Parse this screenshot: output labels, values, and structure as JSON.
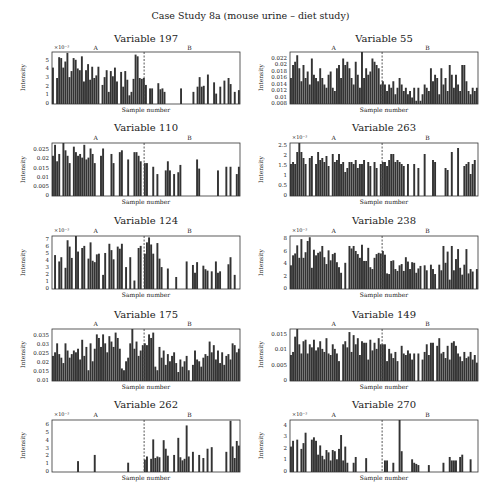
{
  "title": "Case Study 8a (mouse urine – diet study)",
  "colors": {
    "bar": "#333333",
    "divider": "#444444",
    "frame": "#333333"
  },
  "chart_data": [
    {
      "type": "bar",
      "title": "Variable 197",
      "xlabel": "Sample number",
      "ylabel": "Intensity",
      "exponent": "×10⁻³",
      "groups": [
        "A",
        "B"
      ],
      "yticks": [
        "0",
        "1",
        "2",
        "3",
        "4",
        "5"
      ],
      "ylim": [
        0,
        6
      ],
      "divider_fraction": 0.49,
      "values": [
        4.2,
        0,
        3.0,
        5.4,
        5.3,
        4.2,
        4.9,
        5.9,
        3.1,
        3.8,
        5.3,
        5.1,
        4.1,
        3.9,
        5.5,
        2.6,
        3.9,
        4.6,
        2.8,
        4.3,
        3.0,
        3.3,
        4.3,
        0,
        2.2,
        3.1,
        3.9,
        1.4,
        3.8,
        3.2,
        4.2,
        2.6,
        0,
        3.7,
        2.0,
        3.8,
        2.8,
        1.0,
        1.4,
        2.9,
        5.7,
        5.5,
        3.0,
        2.9,
        3.0,
        2.2,
        0,
        1.8,
        1.8,
        0,
        0,
        2.4,
        1.7,
        1.8,
        1.4,
        0,
        0,
        0,
        0,
        0,
        0,
        0,
        1.8,
        0,
        0,
        0,
        0,
        0,
        1.4,
        0,
        2.0,
        3.1,
        2.0,
        2.1,
        0,
        3.4,
        0,
        0,
        2.5,
        1.2,
        0,
        2.0,
        0,
        2.7,
        0,
        3.0,
        2.3,
        0,
        1.4,
        0,
        1.6
      ]
    },
    {
      "type": "bar",
      "title": "Variable 55",
      "xlabel": "Sample number",
      "ylabel": "Intensity",
      "groups": [
        "A",
        "B"
      ],
      "yticks": [
        "0.008",
        "0.01",
        "0.012",
        "0.014",
        "0.016",
        "0.018",
        "0.02",
        "0.022"
      ],
      "ylim": [
        0.008,
        0.024
      ],
      "divider_fraction": 0.49,
      "values": [
        0.016,
        0.02,
        0.021,
        0.023,
        0.019,
        0.015,
        0.02,
        0.016,
        0.018,
        0.014,
        0.022,
        0.017,
        0.016,
        0.015,
        0.019,
        0.016,
        0.014,
        0.013,
        0.017,
        0.018,
        0.013,
        0.012,
        0.019,
        0.02,
        0.016,
        0.022,
        0.02,
        0.021,
        0.019,
        0.016,
        0.014,
        0.021,
        0.017,
        0.013,
        0.024,
        0.016,
        0.019,
        0.017,
        0.018,
        0.022,
        0.021,
        0.02,
        0.019,
        0.014,
        0.015,
        0.014,
        0.012,
        0.014,
        0.013,
        0.015,
        0.011,
        0.013,
        0.016,
        0.014,
        0.012,
        0.013,
        0.011,
        0.012,
        0.01,
        0.013,
        0.009,
        0.013,
        0.009,
        0.011,
        0.014,
        0.013,
        0.012,
        0.019,
        0.015,
        0.017,
        0.016,
        0.011,
        0.019,
        0.014,
        0.016,
        0.012,
        0.02,
        0.017,
        0.013,
        0.017,
        0.014,
        0.012,
        0.02,
        0.02,
        0.015,
        0.012,
        0.011,
        0.013,
        0.012,
        0.013
      ]
    },
    {
      "type": "bar",
      "title": "Variable 110",
      "xlabel": "Sample number",
      "ylabel": "Intensity",
      "groups": [
        "A",
        "B"
      ],
      "yticks": [
        "0",
        "0.005",
        "0.01",
        "0.015",
        "0.02",
        "0.025"
      ],
      "ylim": [
        0,
        0.029
      ],
      "divider_fraction": 0.49,
      "values": [
        0.022,
        0.028,
        0.019,
        0.023,
        0,
        0.029,
        0.025,
        0.022,
        0.018,
        0,
        0.027,
        0.024,
        0.022,
        0.023,
        0.021,
        0.028,
        0.02,
        0.021,
        0.026,
        0.023,
        0.018,
        0,
        0,
        0.022,
        0.026,
        0,
        0,
        0,
        0.023,
        0.018,
        0,
        0,
        0.024,
        0.025,
        0,
        0,
        0.02,
        0,
        0,
        0.024,
        0.024,
        0.022,
        0.019,
        0,
        0.018,
        0.018,
        0,
        0,
        0.016,
        0,
        0.012,
        0,
        0,
        0,
        0.014,
        0.019,
        0.014,
        0,
        0.012,
        0,
        0.013,
        0.017,
        0,
        0,
        0,
        0,
        0,
        0,
        0,
        0.02,
        0.015,
        0,
        0,
        0,
        0,
        0,
        0,
        0,
        0,
        0.014,
        0,
        0,
        0,
        0.016,
        0,
        0.016,
        0,
        0,
        0.012,
        0.016
      ]
    },
    {
      "type": "bar",
      "title": "Variable 263",
      "xlabel": "Sample number",
      "ylabel": "Intensity",
      "exponent": "×10⁻³",
      "groups": [
        "A",
        "B"
      ],
      "yticks": [
        "0",
        "0.5",
        "1",
        "1.5",
        "2",
        "2.5"
      ],
      "ylim": [
        0,
        2.65
      ],
      "divider_fraction": 0.49,
      "values": [
        1.6,
        1.7,
        1.6,
        2.2,
        2.7,
        2.2,
        1.9,
        1.6,
        0,
        1.9,
        2.0,
        0,
        1.6,
        2.2,
        1.8,
        1.9,
        1.7,
        2.0,
        1.5,
        0,
        2.1,
        1.7,
        1.8,
        2.1,
        1.6,
        1.7,
        1.2,
        1.4,
        1.7,
        1.7,
        1.6,
        1.8,
        1.4,
        1.6,
        1.6,
        1.8,
        0,
        1.7,
        1.5,
        0,
        1.7,
        1.4,
        0,
        1.6,
        1.7,
        1.7,
        1.5,
        1.8,
        2.1,
        2.1,
        1.7,
        1.8,
        1.7,
        1.6,
        1.5,
        0,
        1.6,
        0,
        0,
        1.6,
        0,
        1.4,
        0,
        0,
        2.1,
        0,
        0,
        0,
        1.8,
        1.7,
        0,
        0,
        0,
        0,
        1.4,
        1.3,
        0,
        2.2,
        0,
        0,
        2.4,
        0,
        0,
        1.5,
        1.6,
        1.7,
        1.1,
        1.6,
        1.8,
        0
      ]
    },
    {
      "type": "bar",
      "title": "Variable 124",
      "xlabel": "Sample number",
      "ylabel": "Intensity",
      "exponent": "×10⁻³",
      "groups": [
        "A",
        "B"
      ],
      "yticks": [
        "0",
        "1",
        "2",
        "3",
        "4",
        "5",
        "6",
        "7"
      ],
      "ylim": [
        0,
        7.5
      ],
      "divider_fraction": 0.49,
      "values": [
        0,
        4.8,
        0,
        3.9,
        4.5,
        0,
        3.0,
        6.9,
        6.0,
        4.4,
        0,
        7.6,
        5.3,
        0,
        5.8,
        6.1,
        0,
        4.3,
        6.6,
        4.0,
        3.8,
        4.9,
        5.0,
        0,
        2.0,
        5.1,
        0,
        6.4,
        5.5,
        4.2,
        0,
        6.0,
        5.7,
        6.4,
        0,
        3.1,
        0,
        4.5,
        0,
        1.2,
        0,
        5.8,
        6.1,
        0,
        5.0,
        6.6,
        7.3,
        6.3,
        5.0,
        0,
        6.5,
        4.3,
        3.1,
        0,
        0,
        2.9,
        0,
        0,
        0,
        1.7,
        0,
        0,
        0,
        0,
        3.9,
        0,
        0,
        3.4,
        2.3,
        3.8,
        0,
        0,
        3.3,
        2.8,
        2.6,
        0,
        2.5,
        0,
        3.9,
        2.3,
        2.5,
        0,
        0,
        0,
        3.5,
        4.5,
        0,
        2.0,
        0,
        0
      ]
    },
    {
      "type": "bar",
      "title": "Variable 238",
      "xlabel": "Sample number",
      "ylabel": "Intensity",
      "exponent": "×10⁻³",
      "groups": [
        "A",
        "B"
      ],
      "yticks": [
        "0",
        "2",
        "4",
        "6",
        "8"
      ],
      "ylim": [
        0,
        8.5
      ],
      "divider_fraction": 0.49,
      "values": [
        3.8,
        5.4,
        5.7,
        7.0,
        5.0,
        8.0,
        5.0,
        5.9,
        7.7,
        8.3,
        3.4,
        6.3,
        5.4,
        5.8,
        6.0,
        6.9,
        5.1,
        4.0,
        6.2,
        4.6,
        5.6,
        5.8,
        4.3,
        3.5,
        2.6,
        0,
        4.2,
        0,
        6.9,
        6.5,
        6.9,
        6.1,
        5.6,
        5.0,
        7.1,
        4.5,
        4.5,
        6.6,
        3.5,
        3.2,
        5.0,
        5.6,
        5.8,
        5.7,
        6.1,
        5.5,
        2.5,
        2.4,
        4.5,
        4.6,
        3.2,
        2.9,
        3.8,
        4.0,
        2.9,
        5.1,
        4.4,
        3.2,
        4.3,
        4.2,
        2.6,
        3.3,
        3.7,
        0,
        3.8,
        3.0,
        0,
        3.9,
        3.2,
        2.4,
        0,
        3.9,
        3.0,
        6.9,
        4.2,
        6.0,
        1.5,
        6.9,
        3.0,
        4.8,
        6.4,
        3.4,
        2.3,
        3.9,
        6.4,
        2.5,
        3.2,
        2.8,
        0,
        3.2
      ]
    },
    {
      "type": "bar",
      "title": "Variable 175",
      "xlabel": "Sample number",
      "ylabel": "Intensity",
      "groups": [
        "A",
        "B"
      ],
      "yticks": [
        "0.01",
        "0.015",
        "0.02",
        "0.025",
        "0.03",
        "0.035"
      ],
      "ylim": [
        0.01,
        0.039
      ],
      "divider_fraction": 0.49,
      "values": [
        0.024,
        0.026,
        0.031,
        0.025,
        0.023,
        0.02,
        0.031,
        0.027,
        0.023,
        0.025,
        0.027,
        0.026,
        0.028,
        0.022,
        0.033,
        0.024,
        0.029,
        0.016,
        0.031,
        0.021,
        0.028,
        0.036,
        0.034,
        0.029,
        0.036,
        0.031,
        0.026,
        0.035,
        0.032,
        0.029,
        0.037,
        0.034,
        0.028,
        0.017,
        0.016,
        0.021,
        0.023,
        0.031,
        0.039,
        0.028,
        0.032,
        0.024,
        0.027,
        0.03,
        0.031,
        0.03,
        0.036,
        0.034,
        0.037,
        0.018,
        0.016,
        0.029,
        0.023,
        0.027,
        0.019,
        0.025,
        0.021,
        0.024,
        0.026,
        0.02,
        0.015,
        0.022,
        0.018,
        0.021,
        0.024,
        0.016,
        0.01,
        0.019,
        0.027,
        0.022,
        0.021,
        0.018,
        0.023,
        0.025,
        0.024,
        0.032,
        0.026,
        0.03,
        0.022,
        0.027,
        0.02,
        0.026,
        0.019,
        0.024,
        0.025,
        0.022,
        0.031,
        0.03,
        0.026,
        0.028
      ]
    },
    {
      "type": "bar",
      "title": "Variable 149",
      "xlabel": "Sample number",
      "ylabel": "Intensity",
      "groups": [
        "A",
        "B"
      ],
      "yticks": [
        "0",
        "0.005",
        "0.01",
        "0.015"
      ],
      "ylim": [
        0,
        0.017
      ],
      "divider_fraction": 0.49,
      "values": [
        0.0085,
        0.0095,
        0.0145,
        0.017,
        0.012,
        0.009,
        0.013,
        0.0135,
        0.009,
        0.012,
        0.011,
        0.0135,
        0.01,
        0.011,
        0.013,
        0.0105,
        0.0095,
        0.014,
        0.009,
        0.0085,
        0.012,
        0.0105,
        0.009,
        0.0065,
        0,
        0.012,
        0.013,
        0.011,
        0.016,
        0.0095,
        0.015,
        0.012,
        0.014,
        0.0085,
        0.013,
        0.0125,
        0.0125,
        0.007,
        0.0135,
        0.01,
        0.0125,
        0.0105,
        0.014,
        0.012,
        0.012,
        0.012,
        0.0065,
        0.0105,
        0.009,
        0.0075,
        0.0095,
        0.0065,
        0,
        0.0115,
        0.009,
        0.0085,
        0.01,
        0.009,
        0.007,
        0.009,
        0,
        0.009,
        0,
        0.007,
        0.0095,
        0.012,
        0.0085,
        0.0125,
        0.0125,
        0,
        0.0115,
        0.014,
        0.009,
        0.0095,
        0.0075,
        0.0115,
        0.007,
        0.0125,
        0.013,
        0.0115,
        0.009,
        0.008,
        0.0065,
        0.0095,
        0.0075,
        0.008,
        0.0095,
        0.007,
        0.0085,
        0.006
      ]
    },
    {
      "type": "bar",
      "title": "Variable 262",
      "xlabel": "Sample number",
      "ylabel": "Intensity",
      "exponent": "×10⁻³",
      "groups": [
        "A",
        "B"
      ],
      "yticks": [
        "0",
        "1",
        "2",
        "3",
        "4",
        "5",
        "6"
      ],
      "ylim": [
        0,
        6.7
      ],
      "divider_fraction": 0.49,
      "values": [
        0,
        0,
        0,
        0,
        0,
        0,
        0,
        0,
        0,
        0,
        0,
        0,
        1.4,
        0,
        0,
        0,
        0,
        0,
        0,
        0,
        2.2,
        0,
        0,
        0,
        0,
        0,
        0,
        0,
        0,
        0,
        0,
        0,
        0,
        0,
        0,
        0,
        1.2,
        0,
        0,
        0,
        0,
        0,
        0,
        0,
        1.6,
        2.0,
        0,
        1.7,
        4.2,
        1.8,
        2.0,
        1.9,
        0,
        4.1,
        3.0,
        2.1,
        0,
        0,
        2.2,
        0,
        4.4,
        1.9,
        1.5,
        1.7,
        6.0,
        2.0,
        0,
        2.6,
        0,
        0,
        2.2,
        0,
        1.8,
        0,
        3.0,
        0,
        3.2,
        0,
        0,
        0,
        0,
        0,
        0,
        2.6,
        0,
        6.6,
        3.3,
        1.8,
        4.0,
        3.4
      ]
    },
    {
      "type": "bar",
      "title": "Variable 270",
      "xlabel": "Sample number",
      "ylabel": "Intensity",
      "exponent": "×10⁻³",
      "groups": [
        "A",
        "B"
      ],
      "yticks": [
        "0",
        "1",
        "2",
        "3",
        "4"
      ],
      "ylim": [
        0,
        4.5
      ],
      "divider_fraction": 0.49,
      "values": [
        2.2,
        2.7,
        0,
        2.8,
        0,
        2.0,
        2.5,
        3.4,
        0,
        0,
        2.8,
        3.0,
        2.7,
        1.5,
        2.3,
        1.4,
        1.1,
        1.9,
        1.7,
        1.0,
        1.9,
        1.8,
        1.1,
        2.0,
        3.2,
        1.0,
        2.2,
        0.8,
        0,
        0,
        0.8,
        1.3,
        0,
        0,
        0,
        0,
        1.2,
        0,
        0,
        0,
        0,
        0,
        0,
        0,
        0,
        1.0,
        1.0,
        0,
        0,
        0.8,
        0,
        0,
        4.5,
        1.8,
        0,
        0,
        0,
        0,
        1.1,
        0.8,
        0.7,
        0.6,
        0,
        0,
        0,
        0,
        0.6,
        0,
        0,
        0,
        0,
        0,
        0,
        0.8,
        0,
        0,
        1.3,
        1.0,
        1.0,
        1.0,
        0,
        1.3,
        1.5,
        0,
        0,
        0,
        1.1,
        0,
        0,
        0
      ]
    }
  ],
  "layout": {
    "panels": [
      {
        "x": 52,
        "y": 52,
        "w": 188,
        "h": 52,
        "ty": 33,
        "grpy": 44,
        "expx": 52,
        "xly": 106
      },
      {
        "x": 290,
        "y": 52,
        "w": 188,
        "h": 52,
        "ty": 33,
        "grpy": 44,
        "xly": 106
      },
      {
        "x": 52,
        "y": 143,
        "w": 188,
        "h": 53,
        "ty": 122,
        "grpy": 134,
        "xly": 198
      },
      {
        "x": 290,
        "y": 143,
        "w": 188,
        "h": 53,
        "ty": 122,
        "grpy": 134,
        "expx": 290,
        "xly": 198
      },
      {
        "x": 52,
        "y": 236,
        "w": 188,
        "h": 53,
        "ty": 215,
        "grpy": 227,
        "expx": 52,
        "xly": 291
      },
      {
        "x": 290,
        "y": 236,
        "w": 188,
        "h": 53,
        "ty": 215,
        "grpy": 227,
        "expx": 290,
        "xly": 291
      },
      {
        "x": 52,
        "y": 329,
        "w": 188,
        "h": 52,
        "ty": 309,
        "grpy": 320,
        "xly": 383
      },
      {
        "x": 290,
        "y": 329,
        "w": 188,
        "h": 52,
        "ty": 309,
        "grpy": 320,
        "xly": 383
      },
      {
        "x": 52,
        "y": 420,
        "w": 188,
        "h": 52,
        "ty": 399,
        "grpy": 411,
        "expx": 52,
        "xly": 474
      },
      {
        "x": 290,
        "y": 420,
        "w": 188,
        "h": 52,
        "ty": 399,
        "grpy": 411,
        "expx": 290,
        "xly": 474
      }
    ]
  }
}
